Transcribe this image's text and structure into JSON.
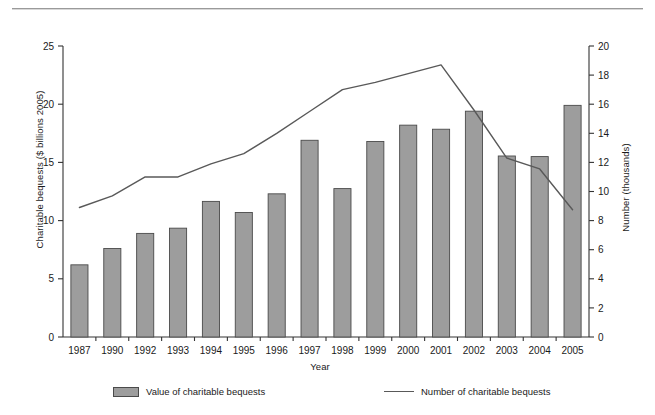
{
  "chart_data": {
    "type": "bar",
    "title": "",
    "xlabel": "Year",
    "ylabel": "Charitable bequests ($ billions 2005)",
    "y2label": "Number (thousands)",
    "categories": [
      "1987",
      "1990",
      "1992",
      "1993",
      "1994",
      "1995",
      "1996",
      "1997",
      "1998",
      "1999",
      "2000",
      "2001",
      "2002",
      "2003",
      "2004",
      "2005"
    ],
    "ylim": [
      0,
      25
    ],
    "yticks": [
      0,
      5,
      10,
      15,
      20,
      25
    ],
    "y2lim": [
      0,
      20
    ],
    "y2ticks": [
      0,
      2,
      4,
      6,
      8,
      10,
      12,
      14,
      16,
      18,
      20
    ],
    "grid": false,
    "legend_position": "bottom",
    "series": [
      {
        "name": "Value of charitable bequests",
        "chart_type": "bar",
        "axis": "left",
        "unit": "$ billions 2005",
        "color": "#9d9d9d",
        "edge_color": "#4a4a4a",
        "values": [
          6.2,
          7.6,
          8.9,
          9.35,
          11.65,
          10.7,
          12.3,
          16.9,
          12.75,
          16.8,
          18.2,
          17.85,
          19.4,
          15.55,
          15.5,
          19.9
        ]
      },
      {
        "name": "Number of charitable bequests",
        "chart_type": "line",
        "axis": "right",
        "unit": "thousands",
        "color": "#595959",
        "values": [
          8.9,
          9.7,
          11.0,
          11.0,
          11.9,
          12.6,
          14.0,
          15.5,
          17.0,
          17.5,
          18.1,
          18.7,
          15.6,
          12.3,
          11.55,
          8.75
        ]
      }
    ]
  },
  "legend": {
    "bar_label": "Value of charitable bequests",
    "line_label": "Number of charitable bequests"
  },
  "axes": {
    "x_title": "Year",
    "y_left_title": "Charitable bequests ($ billions 2005)",
    "y_right_title": "Number (thousands)"
  }
}
